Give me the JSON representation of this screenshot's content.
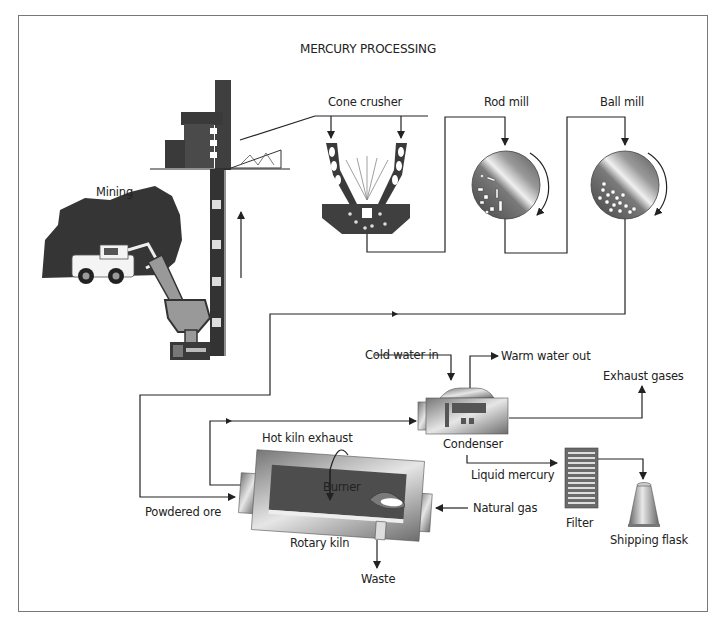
{
  "title": "MERCURY PROCESSING",
  "labels": {
    "mining": "Mining",
    "cone_crusher": "Cone crusher",
    "rod_mill": "Rod mill",
    "ball_mill": "Ball mill",
    "cold_water_in": "Cold water in",
    "warm_water_out": "Warm water out",
    "exhaust_gases": "Exhaust gases",
    "condenser": "Condenser",
    "hot_kiln_exhaust": "Hot kiln exhaust",
    "liquid_mercury": "Liquid mercury",
    "burner": "Burner",
    "powdered_ore": "Powdered ore",
    "natural_gas": "Natural gas",
    "filter": "Filter",
    "rotary_kiln": "Rotary kiln",
    "shipping_flask": "Shipping flask",
    "waste": "Waste"
  },
  "colors": {
    "dark": "#3a3a3a",
    "mid": "#8a8a8a",
    "line": "#222222",
    "frame": "#777777"
  },
  "flow": [
    "Mining",
    "Cone crusher",
    "Rod mill",
    "Ball mill",
    "Powdered ore",
    "Rotary kiln",
    "Condenser",
    "Filter",
    "Shipping flask"
  ]
}
